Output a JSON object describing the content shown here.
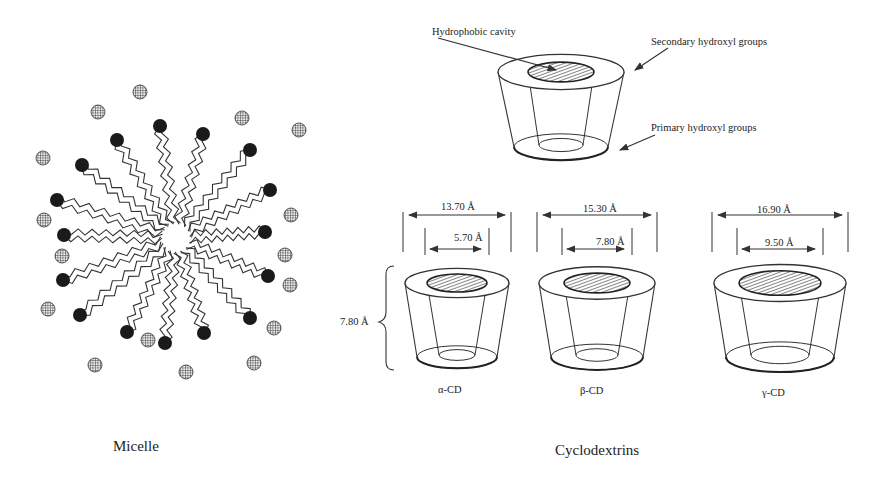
{
  "micelle": {
    "caption": "Micelle",
    "heads": [
      [
        160,
        126
      ],
      [
        203,
        134
      ],
      [
        250,
        150
      ],
      [
        270,
        190
      ],
      [
        265,
        232
      ],
      [
        268,
        276
      ],
      [
        250,
        318
      ],
      [
        204,
        333
      ],
      [
        165,
        343
      ],
      [
        127,
        332
      ],
      [
        80,
        315
      ],
      [
        63,
        280
      ],
      [
        64,
        235
      ],
      [
        57,
        200
      ],
      [
        82,
        165
      ],
      [
        117,
        140
      ]
    ],
    "counterions": [
      [
        140,
        92
      ],
      [
        98,
        112
      ],
      [
        242,
        118
      ],
      [
        299,
        130
      ],
      [
        43,
        158
      ],
      [
        44,
        220
      ],
      [
        291,
        215
      ],
      [
        285,
        255
      ],
      [
        62,
        256
      ],
      [
        48,
        309
      ],
      [
        290,
        285
      ],
      [
        274,
        328
      ],
      [
        148,
        340
      ],
      [
        95,
        365
      ],
      [
        186,
        372
      ],
      [
        254,
        363
      ]
    ],
    "center": [
      176,
      238
    ]
  },
  "cyclodextrin_general": {
    "labels": {
      "cavity": "Hydrophobic cavity",
      "secondary": "Secondary hydroxyl groups",
      "primary": "Primary hydroxyl groups"
    }
  },
  "cyclodextrins": {
    "caption": "Cyclodextrins",
    "height_label": "7.80 Å",
    "items": [
      {
        "name": "α-CD",
        "outer": "13.70 Å",
        "inner": "5.70 Å",
        "cx": 457,
        "rTop": 52,
        "rBot": 40,
        "rIn": 30
      },
      {
        "name": "β-CD",
        "outer": "15.30 Å",
        "inner": "7.80 Å",
        "cx": 597,
        "rTop": 58,
        "rBot": 46,
        "rIn": 33
      },
      {
        "name": "γ-CD",
        "outer": "16.90 Å",
        "inner": "9.50 Å",
        "cx": 780,
        "rTop": 66,
        "rBot": 54,
        "rIn": 41
      }
    ]
  }
}
